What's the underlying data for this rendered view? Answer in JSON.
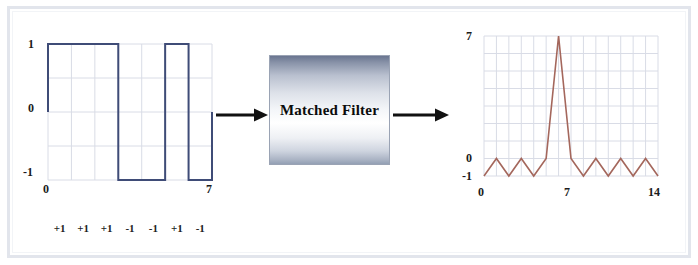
{
  "figure": {
    "background_color": "#ffffff",
    "frame_color": "#e2e5ec"
  },
  "block": {
    "label": "Matched Filter",
    "gradient_top_color": "#6a7590",
    "gradient_mid_color": "#ffffff",
    "gradient_bottom_color": "#93a0b4",
    "border_color": "#9aa3b4"
  },
  "arrows": {
    "input_arrow_name": "input-arrow",
    "output_arrow_name": "output-arrow",
    "color": "#111111"
  },
  "chart_data": [
    {
      "type": "line",
      "name": "barker-code-waveform",
      "title": "",
      "xlabel": "",
      "ylabel": "",
      "trace_color": "#3f4c77",
      "grid": true,
      "grid_color": "#d9dce6",
      "xlim": [
        0,
        7
      ],
      "ylim": [
        -1,
        1
      ],
      "xticks": [
        0,
        1,
        2,
        3,
        4,
        5,
        6,
        7
      ],
      "xtick_labels": [
        "0",
        "",
        "",
        "",
        "",
        "",
        "",
        "7"
      ],
      "yticks": [
        -1,
        -0.5,
        0,
        0.5,
        1
      ],
      "ytick_labels": [
        "-1",
        "",
        "0",
        "",
        "1"
      ],
      "waveform_style": "square",
      "x": [
        0,
        1,
        2,
        3,
        4,
        5,
        6,
        7
      ],
      "values": [
        1,
        1,
        1,
        -1,
        -1,
        1,
        -1
      ],
      "bit_labels": [
        "+1",
        "+1",
        "+1",
        "-1",
        "-1",
        "+1",
        "-1"
      ]
    },
    {
      "type": "line",
      "name": "autocorrelation-output",
      "title": "",
      "xlabel": "",
      "ylabel": "",
      "trace_color": "#a4675c",
      "grid": true,
      "grid_color": "#d9dce6",
      "xlim": [
        0,
        14
      ],
      "ylim": [
        -1,
        7
      ],
      "xticks": [
        0,
        1,
        2,
        3,
        4,
        5,
        6,
        7,
        8,
        9,
        10,
        11,
        12,
        13,
        14
      ],
      "xtick_labels": [
        "0",
        "",
        "",
        "",
        "",
        "",
        "",
        "7",
        "",
        "",
        "",
        "",
        "",
        "",
        "14"
      ],
      "yticks": [
        -1,
        0,
        1,
        2,
        3,
        4,
        5,
        6,
        7
      ],
      "ytick_labels": [
        "-1",
        "0",
        "",
        "",
        "",
        "",
        "",
        "",
        "7"
      ],
      "x": [
        0,
        1,
        2,
        3,
        4,
        5,
        6,
        7,
        8,
        9,
        10,
        11,
        12,
        13,
        14
      ],
      "values": [
        -1,
        0,
        -1,
        0,
        -1,
        0,
        7,
        0,
        -1,
        0,
        -1,
        0,
        -1,
        0,
        -1
      ],
      "peak": {
        "x": 7,
        "y": 7
      },
      "sidelobe_values": [
        0,
        -1
      ]
    }
  ]
}
